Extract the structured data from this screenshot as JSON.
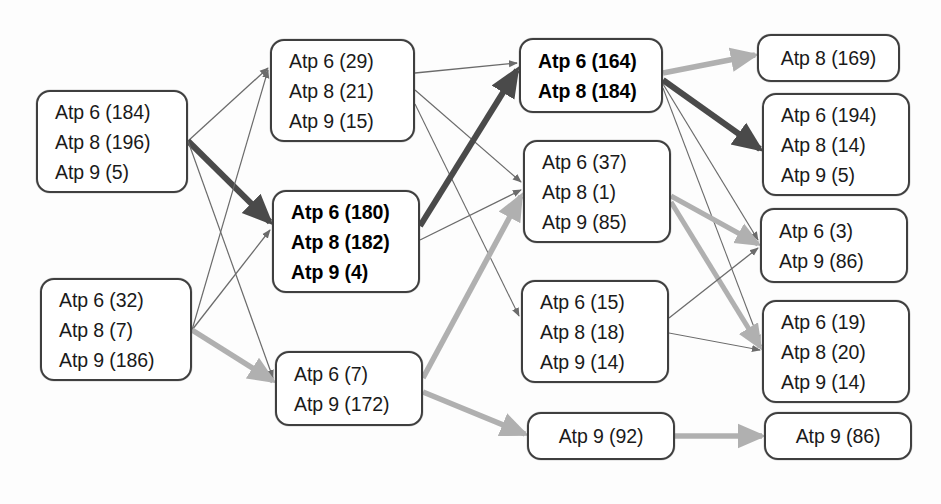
{
  "diagram": {
    "type": "layered-flow-diagram",
    "background_color": "#fdfdfd",
    "node_border_color": "#3f3f3f",
    "edge_colors": {
      "thin_dark": "#6b6b6b",
      "thick_dark": "#4a4a4a",
      "thick_light": "#b0b0b0"
    },
    "columns": [
      {
        "index": 0,
        "name": "column-1",
        "nodes": [
          {
            "id": "n1",
            "emphasis": false,
            "x": 36,
            "y": 90,
            "w": 152,
            "h": 103,
            "lines": [
              "Atp 6 (184)",
              "Atp 8 (196)",
              "Atp 9 (5)"
            ]
          },
          {
            "id": "n2",
            "emphasis": false,
            "x": 40,
            "y": 278,
            "w": 152,
            "h": 103,
            "lines": [
              "Atp 6 (32)",
              "Atp 8 (7)",
              "Atp 9 (186)"
            ]
          }
        ]
      },
      {
        "index": 1,
        "name": "column-2",
        "nodes": [
          {
            "id": "n3",
            "emphasis": false,
            "x": 270,
            "y": 39,
            "w": 145,
            "h": 103,
            "lines": [
              "Atp 6 (29)",
              "Atp 8 (21)",
              "Atp 9 (15)"
            ]
          },
          {
            "id": "n4",
            "emphasis": true,
            "x": 272,
            "y": 190,
            "w": 148,
            "h": 103,
            "lines": [
              "Atp 6 (180)",
              "Atp 8 (182)",
              "Atp 9 (4)"
            ]
          },
          {
            "id": "n5",
            "emphasis": false,
            "x": 275,
            "y": 351,
            "w": 148,
            "h": 75,
            "lines": [
              "Atp 6 (7)",
              "Atp 9 (172)"
            ]
          }
        ]
      },
      {
        "index": 2,
        "name": "column-3",
        "nodes": [
          {
            "id": "n6",
            "emphasis": true,
            "x": 519,
            "y": 38,
            "w": 144,
            "h": 75,
            "lines": [
              "Atp 6 (164)",
              "Atp 8 (184)"
            ]
          },
          {
            "id": "n7",
            "emphasis": false,
            "x": 523,
            "y": 140,
            "w": 148,
            "h": 103,
            "lines": [
              "Atp 6 (37)",
              "Atp 8 (1)",
              "Atp 9 (85)"
            ]
          },
          {
            "id": "n8",
            "emphasis": false,
            "x": 521,
            "y": 280,
            "w": 148,
            "h": 103,
            "lines": [
              "Atp 6 (15)",
              "Atp 8 (18)",
              "Atp 9 (14)"
            ]
          },
          {
            "id": "n9",
            "emphasis": false,
            "x": 527,
            "y": 412,
            "w": 148,
            "h": 48,
            "centered": true,
            "lines": [
              "Atp 9 (92)"
            ]
          }
        ]
      },
      {
        "index": 3,
        "name": "column-4",
        "nodes": [
          {
            "id": "n10",
            "emphasis": false,
            "x": 757,
            "y": 34,
            "w": 143,
            "h": 48,
            "centered": true,
            "lines": [
              "Atp 8 (169)"
            ]
          },
          {
            "id": "n11",
            "emphasis": false,
            "x": 762,
            "y": 93,
            "w": 148,
            "h": 103,
            "lines": [
              "Atp 6 (194)",
              "Atp 8 (14)",
              "Atp 9 (5)"
            ]
          },
          {
            "id": "n12",
            "emphasis": false,
            "x": 760,
            "y": 208,
            "w": 148,
            "h": 75,
            "lines": [
              "Atp 6 (3)",
              "Atp 9 (86)"
            ]
          },
          {
            "id": "n13",
            "emphasis": false,
            "x": 762,
            "y": 300,
            "w": 148,
            "h": 103,
            "lines": [
              "Atp 6 (19)",
              "Atp 8 (20)",
              "Atp 9 (14)"
            ]
          },
          {
            "id": "n14",
            "emphasis": false,
            "x": 764,
            "y": 412,
            "w": 148,
            "h": 48,
            "centered": true,
            "lines": [
              "Atp 9 (86)"
            ]
          }
        ]
      }
    ],
    "edges": [
      {
        "name": "edge-n1-n3",
        "from": [
          188,
          141
        ],
        "to": [
          268,
          68
        ],
        "style": "thin_dark",
        "width": 1.3
      },
      {
        "name": "edge-n1-n4",
        "from": [
          188,
          141
        ],
        "to": [
          270,
          222
        ],
        "style": "thick_dark",
        "width": 6.0
      },
      {
        "name": "edge-n1-n5",
        "from": [
          188,
          141
        ],
        "to": [
          273,
          378
        ],
        "style": "thin_dark",
        "width": 1.2
      },
      {
        "name": "edge-n2-n3",
        "from": [
          192,
          330
        ],
        "to": [
          268,
          70
        ],
        "style": "thin_dark",
        "width": 1.2
      },
      {
        "name": "edge-n2-n4",
        "from": [
          192,
          330
        ],
        "to": [
          270,
          230
        ],
        "style": "thin_dark",
        "width": 1.3
      },
      {
        "name": "edge-n2-n5",
        "from": [
          192,
          330
        ],
        "to": [
          273,
          381
        ],
        "style": "thick_light",
        "width": 5.5
      },
      {
        "name": "edge-n3-n6",
        "from": [
          415,
          73
        ],
        "to": [
          517,
          63
        ],
        "style": "thin_dark",
        "width": 1.3
      },
      {
        "name": "edge-n3-n7",
        "from": [
          415,
          90
        ],
        "to": [
          521,
          182
        ],
        "style": "thin_dark",
        "width": 1.2
      },
      {
        "name": "edge-n3-n8",
        "from": [
          415,
          104
        ],
        "to": [
          519,
          316
        ],
        "style": "thin_dark",
        "width": 1.1
      },
      {
        "name": "edge-n4-n6",
        "from": [
          420,
          226
        ],
        "to": [
          517,
          70
        ],
        "style": "thick_dark",
        "width": 6.0
      },
      {
        "name": "edge-n4-n7",
        "from": [
          420,
          240
        ],
        "to": [
          521,
          190
        ],
        "style": "thin_dark",
        "width": 1.3
      },
      {
        "name": "edge-n5-n7",
        "from": [
          423,
          378
        ],
        "to": [
          521,
          196
        ],
        "style": "thick_light",
        "width": 5.5
      },
      {
        "name": "edge-n5-n9",
        "from": [
          423,
          392
        ],
        "to": [
          525,
          434
        ],
        "style": "thick_light",
        "width": 5.5
      },
      {
        "name": "edge-n6-n10",
        "from": [
          663,
          73
        ],
        "to": [
          755,
          55
        ],
        "style": "thick_light",
        "width": 5.5
      },
      {
        "name": "edge-n6-n11",
        "from": [
          663,
          80
        ],
        "to": [
          760,
          149
        ],
        "style": "thick_dark",
        "width": 6.0
      },
      {
        "name": "edge-n6-n12",
        "from": [
          663,
          84
        ],
        "to": [
          758,
          240
        ],
        "style": "thin_dark",
        "width": 1.2
      },
      {
        "name": "edge-n6-n13",
        "from": [
          663,
          88
        ],
        "to": [
          760,
          343
        ],
        "style": "thin_dark",
        "width": 1.1
      },
      {
        "name": "edge-n7-n12",
        "from": [
          671,
          196
        ],
        "to": [
          758,
          244
        ],
        "style": "thick_light",
        "width": 5.0
      },
      {
        "name": "edge-n7-n13",
        "from": [
          671,
          202
        ],
        "to": [
          760,
          347
        ],
        "style": "thick_light",
        "width": 5.0
      },
      {
        "name": "edge-n8-n12",
        "from": [
          669,
          318
        ],
        "to": [
          758,
          248
        ],
        "style": "thin_dark",
        "width": 1.3
      },
      {
        "name": "edge-n9-n14",
        "from": [
          675,
          436
        ],
        "to": [
          762,
          436
        ],
        "style": "thick_light",
        "width": 5.5
      },
      {
        "name": "edge-n8-n13",
        "from": [
          669,
          333
        ],
        "to": [
          760,
          350
        ],
        "style": "thin_dark",
        "width": 1.0
      }
    ]
  }
}
